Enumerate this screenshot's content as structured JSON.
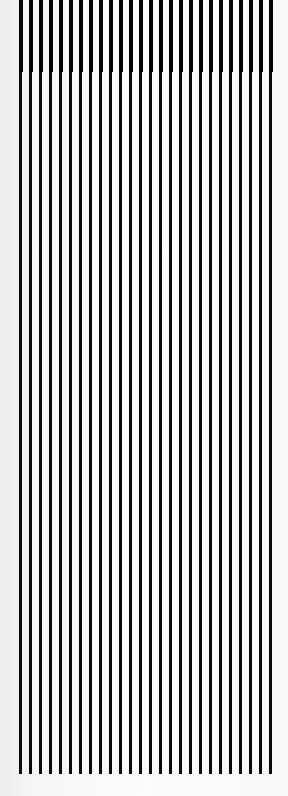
{
  "pattern": {
    "type": "vertical-stripes",
    "line_count": 26,
    "start_x": 19,
    "spacing": 10,
    "line_width": 3,
    "top_band_height": 72,
    "top_band_line_width": 4,
    "line_top": 0,
    "line_bottom": 774,
    "line_color": "#0a0a0a",
    "background_color": "#f8f8f8"
  }
}
